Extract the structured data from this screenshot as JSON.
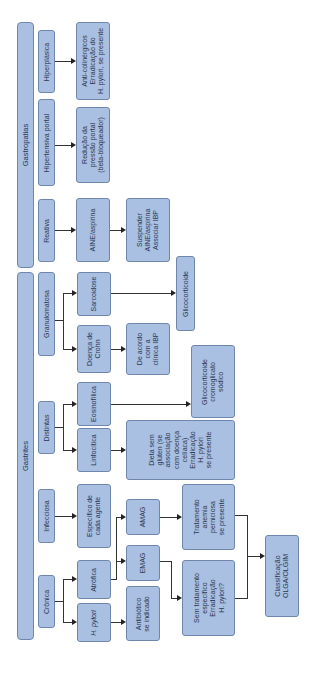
{
  "diagram": {
    "orientation": "rotated 90deg counter-clockwise (text reads bottom-to-top)",
    "roots": {
      "gastropatias": "Gastropatias",
      "gastrites": "Gastrites"
    },
    "gastropatias": {
      "hiperplasica": "Hiperplásica",
      "hiperplasica_tx": "Anti-colinérgicos\nErradicação do\nH. pylori, se presente",
      "hipertensiva": "Hipertensiva portal",
      "hipertensiva_tx": "Redução da\npressão portal\n(beta-bloqueador)",
      "reativa": "Reativa",
      "aine": "AINE/aspirina",
      "aine_tx": "Suspender\nAINE/aspirina\nAssociar IBP"
    },
    "gastrites": {
      "granulomatosa": "Granulomatosa",
      "sarcoidose": "Sarcoidose",
      "crohn": "Doença de\nCrohn",
      "crohn_tx": "De acordo\ncom a\nclínica IBP",
      "glicocorticoide": "Glicocorticoide",
      "distintas": "Distintas",
      "eosinofilica": "Eosinofílica",
      "eosinofilica_tx": "Glicocorticoide\ncromoglicato\nsódico",
      "linfocitica": "Linfocítica",
      "linfocitica_tx": "Dieta sem\nglúten (se\nassociação\ncom doença\ncelíaca)\nErradicação\nH. pylori\nse presente",
      "infecciosa": "Infecciosa",
      "infecciosa_tx": "Específico de\ncada agente",
      "cronica": "Crônica",
      "atrofica": "Atrófica",
      "hpylori": "H. pylori",
      "amag": "AMAG",
      "emag": "EMAG",
      "antibiotico": "Antibiótico\nse indicado",
      "amag_tx": "Tratamento\nanemia\nperniciosa\nse presente",
      "emag_tx": "Sem tratamento\nespecífico\nErradicação\nH. pylori?",
      "classificacao": "Classificação\nOLGA/OLGIM"
    },
    "colors": {
      "box_fill": "#a9c0e2",
      "box_border": "#6f86ad",
      "line": "#333333"
    }
  }
}
